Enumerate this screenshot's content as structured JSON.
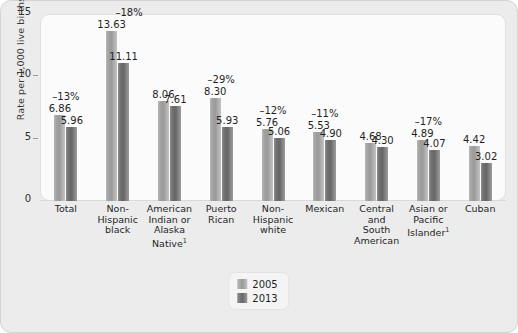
{
  "chart_data": {
    "type": "bar",
    "title": "",
    "xlabel": "",
    "ylabel": "Rate per 1,000 live births",
    "ylim": [
      0,
      15
    ],
    "yticks": [
      0,
      5,
      10,
      15
    ],
    "grid": false,
    "legend_position": "bottom-center",
    "categories": [
      "Total",
      "Non-Hispanic black",
      "American Indian or Alaska Native¹",
      "Puerto Rican",
      "Non-Hispanic white",
      "Mexican",
      "Central and South American",
      "Asian or Pacific Islander¹",
      "Cuban"
    ],
    "category_lines": [
      [
        "Total"
      ],
      [
        "Non-",
        "Hispanic",
        "black"
      ],
      [
        "American",
        "Indian or",
        "Alaska",
        "Native¹"
      ],
      [
        "Puerto",
        "Rican"
      ],
      [
        "Non-",
        "Hispanic",
        "white"
      ],
      [
        "Mexican"
      ],
      [
        "Central",
        "and",
        "South",
        "American"
      ],
      [
        "Asian or",
        "Pacific",
        "Islander¹"
      ],
      [
        "Cuban"
      ]
    ],
    "series": [
      {
        "name": "2005",
        "values": [
          6.86,
          13.63,
          8.06,
          8.3,
          5.76,
          5.53,
          4.68,
          4.89,
          4.42
        ],
        "labels": [
          "6.86",
          "13.63",
          "8.06",
          "8.30",
          "5.76",
          "5.53",
          "4.68",
          "4.89",
          "4.42"
        ],
        "color": "#9a9a9a"
      },
      {
        "name": "2013",
        "values": [
          5.96,
          11.11,
          7.61,
          5.93,
          5.06,
          4.9,
          4.3,
          4.07,
          3.02
        ],
        "labels": [
          "5.96",
          "11.11",
          "7.61",
          "5.93",
          "5.06",
          "4.90",
          "4.30",
          "4.07",
          "3.02"
        ],
        "color": "#676767"
      }
    ],
    "percent_change_labels": [
      "–13%",
      "–18%",
      "",
      "–29%",
      "–12%",
      "–11%",
      "",
      "–17%",
      ""
    ],
    "colors": {
      "series_2005": "#9a9a9a",
      "series_2013": "#676767",
      "figure_background": "#ececed",
      "plot_background": "#fbfbfb",
      "axis": "#9a9a9a",
      "text": "#1f1f1f"
    }
  },
  "legend": {
    "entries": [
      {
        "label": "2005"
      },
      {
        "label": "2013"
      }
    ]
  }
}
